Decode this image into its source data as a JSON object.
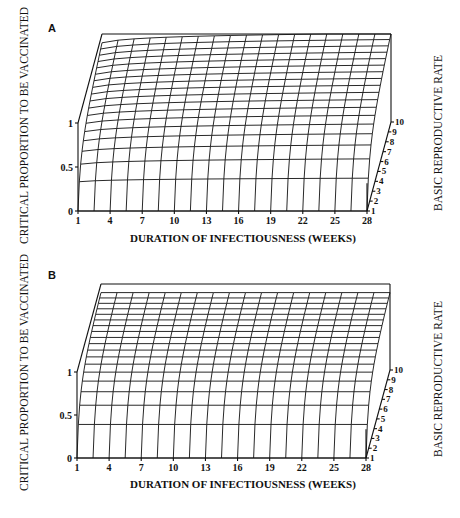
{
  "chart_data": [
    {
      "panel": "A",
      "type": "surface3d",
      "title": "",
      "xlabel": "DURATION OF INFECTIOUSNESS (WEEKS)",
      "ylabel": "CRITICAL PROPORTION TO BE VACCINATED",
      "zlabel": "BASIC REPRODUCTIVE RATE",
      "x_ticks": [
        "1",
        "4",
        "7",
        "10",
        "13",
        "16",
        "19",
        "22",
        "25",
        "28"
      ],
      "y_ticks": [
        "0",
        "0.5",
        "1"
      ],
      "z_ticks": [
        "1",
        "2",
        "3",
        "4",
        "5",
        "6",
        "7",
        "8",
        "9",
        "10"
      ],
      "xlim": [
        1,
        28
      ],
      "ylim": [
        0,
        1
      ],
      "zlim": [
        1,
        10
      ],
      "grid": true,
      "description": "Critical proportion rises with both reproductive rate and duration of infectiousness; at R=1 near 0, rising toward ~1 for high R; front edge (R=1) is ~0; row for R=2 ranges ~0.4 to ~0.55 across durations."
    },
    {
      "panel": "B",
      "type": "surface3d",
      "title": "",
      "xlabel": "DURATION OF INFECTIOUSNESS (WEEKS)",
      "ylabel": "CRITICAL PROPORTION TO BE VACCINATED",
      "zlabel": "BASIC REPRODUCTIVE RATE",
      "x_ticks": [
        "1",
        "4",
        "7",
        "10",
        "13",
        "16",
        "19",
        "22",
        "25",
        "28"
      ],
      "y_ticks": [
        "0",
        "0.5",
        "1"
      ],
      "z_ticks": [
        "1",
        "2",
        "3",
        "4",
        "5",
        "6",
        "7",
        "8",
        "9",
        "10"
      ],
      "xlim": [
        1,
        28
      ],
      "ylim": [
        0,
        1
      ],
      "zlim": [
        1,
        10
      ],
      "grid": true,
      "description": "Critical proportion independent of duration; p = 1 - 1/R: R=1 → 0, R=2 → 0.5, R=10 → 0.9."
    }
  ],
  "panels": {
    "a": {
      "letter": "A",
      "ylabel": "CRITICAL PROPORTION TO BE VACCINATED",
      "xlabel": "DURATION OF INFECTIOUSNESS (WEEKS)",
      "rlabel": "BASIC REPRODUCTIVE RATE"
    },
    "b": {
      "letter": "B",
      "ylabel": "CRITICAL PROPORTION TO BE VACCINATED",
      "xlabel": "DURATION OF INFECTIOUSNESS (WEEKS)",
      "rlabel": "BASIC REPRODUCTIVE RATE"
    }
  },
  "axes": {
    "x_ticks": [
      "1",
      "4",
      "7",
      "10",
      "13",
      "16",
      "19",
      "22",
      "25",
      "28"
    ],
    "y_ticks": [
      "0",
      "0.5",
      "1"
    ],
    "r_ticks": [
      "1",
      "2",
      "3",
      "4",
      "5",
      "6",
      "7",
      "8",
      "9",
      "10"
    ]
  }
}
